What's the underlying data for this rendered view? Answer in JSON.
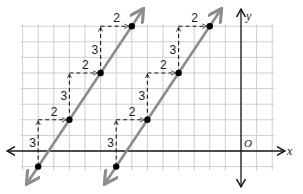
{
  "diagram": {
    "type": "coordinate-plane-parallel-lines",
    "axes": {
      "x_label": "x",
      "y_label": "y",
      "origin_label": "O"
    },
    "grid": {
      "unit_px": 15.6,
      "origin_px": [
        241,
        151
      ],
      "x_range": [
        -14,
        2
      ],
      "y_range": [
        -1,
        8
      ]
    },
    "colors": {
      "axis": "#1a1a1a",
      "grid": "#c8c8c8",
      "line": "#8c8c8c",
      "dash": "#1a1a1a",
      "point": "#000000"
    },
    "lines": [
      {
        "name": "left-line",
        "points": [
          [
            -13,
            -1
          ],
          [
            -11,
            2
          ],
          [
            -9,
            5
          ],
          [
            -7,
            8
          ]
        ],
        "rise_label": "3",
        "run_label": "2"
      },
      {
        "name": "right-line",
        "points": [
          [
            -8,
            -1
          ],
          [
            -6,
            2
          ],
          [
            -4,
            5
          ],
          [
            -2,
            8
          ]
        ],
        "rise_label": "3",
        "run_label": "2"
      }
    ]
  }
}
